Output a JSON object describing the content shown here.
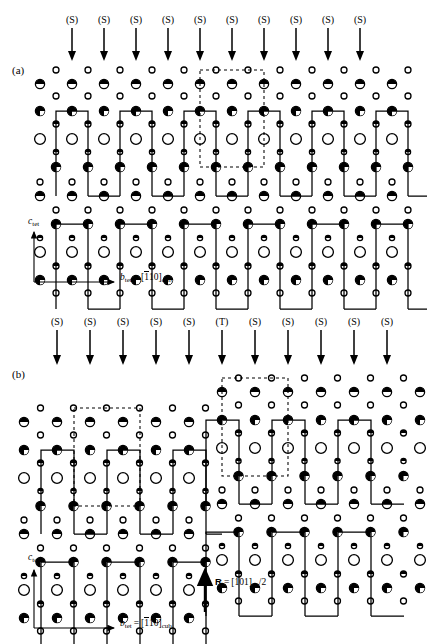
{
  "figure": {
    "type": "crystal-structure-diagram",
    "panels": [
      {
        "id": "a",
        "label": "(a)",
        "arrow_labels": [
          "(S)",
          "(S)",
          "(S)",
          "(S)",
          "(S)",
          "(S)",
          "(S)",
          "(S)",
          "(S)",
          "(S)"
        ],
        "axis": {
          "vertical_label": "c",
          "vertical_sub": "tet",
          "horizontal_label": "b",
          "horizontal_sub": "tet",
          "horizontal_equals": "=",
          "horizontal_index_open": "[",
          "horizontal_index_bar": "1",
          "horizontal_index_rest": "10]",
          "horizontal_index_sub": "cub"
        }
      },
      {
        "id": "b",
        "label": "(b)",
        "arrow_labels": [
          "(S)",
          "(S)",
          "(S)",
          "(S)",
          "(S)",
          "(T)",
          "(S)",
          "(S)",
          "(S)",
          "(S)",
          "(S)"
        ],
        "axis": {
          "vertical_label": "c",
          "vertical_sub": "tet",
          "horizontal_label": "b",
          "horizontal_sub": "tet",
          "horizontal_equals": "=",
          "horizontal_index_open": "[",
          "horizontal_index_bar": "1",
          "horizontal_index_rest": "10]",
          "horizontal_index_sub": "cub"
        },
        "displacement_vector": {
          "symbol": "R",
          "equals": "=",
          "index": "[101]",
          "sub": "tet",
          "divisor": "/2"
        }
      }
    ],
    "atom_types": [
      {
        "name": "small-open-circle",
        "fill": "#ffffff",
        "stroke": "#000000"
      },
      {
        "name": "large-open-circle",
        "fill": "#ffffff",
        "stroke": "#000000"
      },
      {
        "name": "half-filled-top-circle",
        "fill": "#000000",
        "stroke": "#000000"
      },
      {
        "name": "quarter-filled-circle",
        "fill": "#000000",
        "stroke": "#000000"
      },
      {
        "name": "small-half-filled-circle",
        "fill": "#000000",
        "stroke": "#000000"
      }
    ],
    "colors": {
      "ink": "#000000",
      "background": "#ffffff",
      "dashed_cell": "#000000"
    }
  }
}
